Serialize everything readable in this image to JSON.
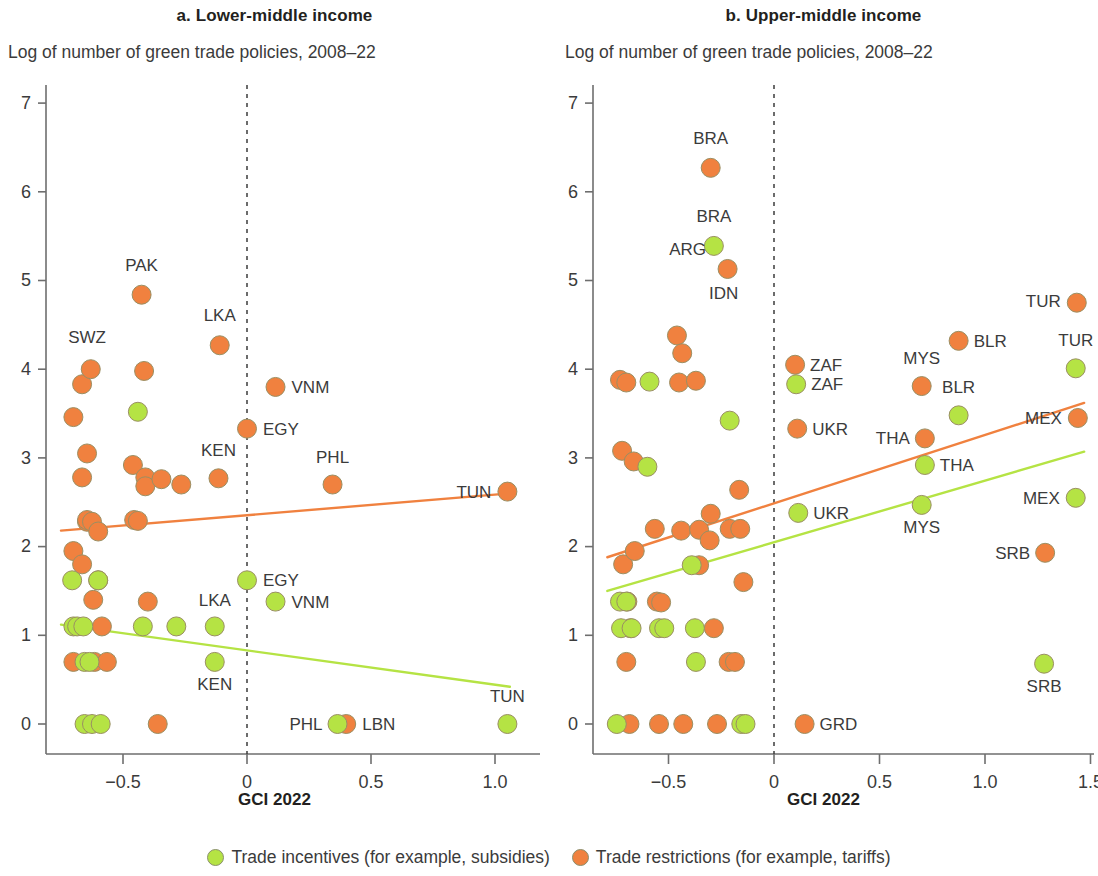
{
  "figure": {
    "x_axis_caption": "GCI 2022",
    "legend": [
      {
        "name": "trade-incentives",
        "label": "Trade incentives (for example, subsidies)",
        "color": "#b5e344"
      },
      {
        "name": "trade-restrictions",
        "label": "Trade restrictions (for example, tariffs)",
        "color": "#f0813f"
      }
    ]
  },
  "chart_data": [
    {
      "type": "scatter",
      "panel": "a",
      "title": "a. Lower-middle income",
      "subtitle": "Log of number of green trade policies, 2008–22",
      "xlabel": "GCI 2022",
      "ylabel": "Log of number of green trade policies, 2008–22",
      "xlim": [
        -0.78,
        1.13
      ],
      "ylim": [
        -0.35,
        7.45
      ],
      "xticks": [
        -0.5,
        0,
        0.5,
        1.0
      ],
      "xticklabels": [
        "−0.5",
        "0",
        "0.5",
        "1.0"
      ],
      "yticks": [
        0,
        1,
        2,
        3,
        4,
        5,
        6,
        7
      ],
      "yticklabels": [
        "0",
        "1",
        "2",
        "3",
        "4",
        "5",
        "6",
        "7"
      ],
      "grid": false,
      "reference_line_x": 0,
      "legend_position": "bottom",
      "series": [
        {
          "name": "Trade restrictions (for example, tariffs)",
          "color": "#f0813f",
          "points": [
            {
              "x": -0.7,
              "y": 3.46
            },
            {
              "x": -0.7,
              "y": 1.95
            },
            {
              "x": -0.7,
              "y": 0.7
            },
            {
              "x": -0.665,
              "y": 2.78
            },
            {
              "x": -0.665,
              "y": 1.8
            },
            {
              "x": -0.665,
              "y": 3.83
            },
            {
              "x": -0.645,
              "y": 3.05
            },
            {
              "x": -0.645,
              "y": 2.28
            },
            {
              "x": -0.645,
              "y": 2.3
            },
            {
              "x": -0.63,
              "y": 4.0
            },
            {
              "x": -0.625,
              "y": 2.28
            },
            {
              "x": -0.62,
              "y": 1.4
            },
            {
              "x": -0.615,
              "y": 0.7
            },
            {
              "x": -0.6,
              "y": 2.17
            },
            {
              "x": -0.6,
              "y": 1.62
            },
            {
              "x": -0.585,
              "y": 1.1
            },
            {
              "x": -0.565,
              "y": 0.7
            },
            {
              "x": -0.46,
              "y": 2.92
            },
            {
              "x": -0.455,
              "y": 2.3
            },
            {
              "x": -0.44,
              "y": 2.29
            },
            {
              "x": -0.425,
              "y": 4.84
            },
            {
              "x": -0.415,
              "y": 3.98
            },
            {
              "x": -0.41,
              "y": 2.78
            },
            {
              "x": -0.41,
              "y": 2.68
            },
            {
              "x": -0.4,
              "y": 1.38
            },
            {
              "x": -0.36,
              "y": 0.0
            },
            {
              "x": -0.345,
              "y": 2.76
            },
            {
              "x": -0.265,
              "y": 2.7
            },
            {
              "x": -0.11,
              "y": 4.27
            },
            {
              "x": -0.115,
              "y": 2.77
            },
            {
              "x": 0.0,
              "y": 3.33
            },
            {
              "x": 0.115,
              "y": 3.8
            },
            {
              "x": 0.345,
              "y": 2.7
            },
            {
              "x": 0.4,
              "y": 0.0
            },
            {
              "x": 1.05,
              "y": 2.62
            }
          ],
          "trend_line": {
            "x1": -0.75,
            "y1": 2.18,
            "x2": 1.06,
            "y2": 2.6
          }
        },
        {
          "name": "Trade incentives (for example, subsidies)",
          "color": "#b5e344",
          "points": [
            {
              "x": -0.705,
              "y": 1.62
            },
            {
              "x": -0.7,
              "y": 1.1
            },
            {
              "x": -0.685,
              "y": 1.1
            },
            {
              "x": -0.66,
              "y": 1.1
            },
            {
              "x": -0.655,
              "y": 0.7
            },
            {
              "x": -0.635,
              "y": 0.7
            },
            {
              "x": -0.655,
              "y": 0.0
            },
            {
              "x": -0.625,
              "y": 0.0
            },
            {
              "x": -0.59,
              "y": 0.0
            },
            {
              "x": -0.6,
              "y": 1.62
            },
            {
              "x": -0.44,
              "y": 3.52
            },
            {
              "x": -0.42,
              "y": 1.1
            },
            {
              "x": -0.285,
              "y": 1.1
            },
            {
              "x": -0.13,
              "y": 1.1
            },
            {
              "x": -0.13,
              "y": 0.7
            },
            {
              "x": 0.0,
              "y": 1.62
            },
            {
              "x": 0.115,
              "y": 1.38
            },
            {
              "x": 0.365,
              "y": 0.0
            },
            {
              "x": 1.05,
              "y": 0.0
            }
          ],
          "trend_line": {
            "x1": -0.75,
            "y1": 1.12,
            "x2": 1.06,
            "y2": 0.42
          }
        }
      ],
      "annotations": [
        {
          "text": "PAK",
          "x": -0.425,
          "y": 4.84,
          "dx": 0,
          "dy": -24,
          "anchor": "middle"
        },
        {
          "text": "SWZ",
          "x": -0.645,
          "y": 4.0,
          "dx": 0,
          "dy": -26,
          "anchor": "middle"
        },
        {
          "text": "LKA",
          "x": -0.11,
          "y": 4.27,
          "dx": 0,
          "dy": -24,
          "anchor": "middle"
        },
        {
          "text": "VNM",
          "x": 0.115,
          "y": 3.8,
          "dx": 16,
          "dy": 6,
          "anchor": "start"
        },
        {
          "text": "EGY",
          "x": 0.0,
          "y": 3.33,
          "dx": 16,
          "dy": 6,
          "anchor": "start"
        },
        {
          "text": "KEN",
          "x": -0.115,
          "y": 2.77,
          "dx": 0,
          "dy": -22,
          "anchor": "middle"
        },
        {
          "text": "PHL",
          "x": 0.345,
          "y": 2.7,
          "dx": 0,
          "dy": -22,
          "anchor": "middle"
        },
        {
          "text": "TUN",
          "x": 1.05,
          "y": 2.62,
          "dx": -16,
          "dy": 6,
          "anchor": "end"
        },
        {
          "text": "EGY",
          "x": 0.0,
          "y": 1.62,
          "dx": 16,
          "dy": 6,
          "anchor": "start"
        },
        {
          "text": "VNM",
          "x": 0.115,
          "y": 1.38,
          "dx": 16,
          "dy": 6,
          "anchor": "start"
        },
        {
          "text": "LKA",
          "x": -0.13,
          "y": 1.1,
          "dx": 0,
          "dy": -20,
          "anchor": "middle"
        },
        {
          "text": "KEN",
          "x": -0.13,
          "y": 0.7,
          "dx": 0,
          "dy": 28,
          "anchor": "middle"
        },
        {
          "text": "PHL",
          "x": 0.365,
          "y": 0.0,
          "dx": -15,
          "dy": 6,
          "anchor": "end"
        },
        {
          "text": "LBN",
          "x": 0.4,
          "y": 0.0,
          "dx": 16,
          "dy": 6,
          "anchor": "start"
        },
        {
          "text": "TUN",
          "x": 1.05,
          "y": 0.0,
          "dx": 0,
          "dy": -22,
          "anchor": "middle"
        }
      ]
    },
    {
      "type": "scatter",
      "panel": "b",
      "title": "b. Upper-middle income",
      "subtitle": "Log of number of green trade policies, 2008–22",
      "xlabel": "GCI 2022",
      "ylabel": "Log of number of green trade policies, 2008–22",
      "xlim": [
        -0.82,
        1.53
      ],
      "ylim": [
        -0.35,
        7.45
      ],
      "xticks": [
        -0.5,
        0,
        0.5,
        1.0,
        1.5
      ],
      "xticklabels": [
        "−0.5",
        "0",
        "0.5",
        "1.0",
        "1.5"
      ],
      "yticks": [
        0,
        1,
        2,
        3,
        4,
        5,
        6,
        7
      ],
      "yticklabels": [
        "0",
        "1",
        "2",
        "3",
        "4",
        "5",
        "6",
        "7"
      ],
      "grid": false,
      "reference_line_x": 0,
      "legend_position": "bottom",
      "series": [
        {
          "name": "Trade restrictions (for example, tariffs)",
          "color": "#f0813f",
          "points": [
            {
              "x": -0.73,
              "y": 3.88
            },
            {
              "x": -0.72,
              "y": 3.08
            },
            {
              "x": -0.715,
              "y": 1.8
            },
            {
              "x": -0.7,
              "y": 3.85
            },
            {
              "x": -0.7,
              "y": 0.7
            },
            {
              "x": -0.695,
              "y": 1.38
            },
            {
              "x": -0.68,
              "y": 1.08
            },
            {
              "x": -0.685,
              "y": 0.0
            },
            {
              "x": -0.665,
              "y": 2.96
            },
            {
              "x": -0.66,
              "y": 1.95
            },
            {
              "x": -0.565,
              "y": 2.2
            },
            {
              "x": -0.555,
              "y": 1.38
            },
            {
              "x": -0.535,
              "y": 1.37
            },
            {
              "x": -0.545,
              "y": 0.0
            },
            {
              "x": -0.46,
              "y": 4.38
            },
            {
              "x": -0.45,
              "y": 3.85
            },
            {
              "x": -0.44,
              "y": 2.18
            },
            {
              "x": -0.435,
              "y": 4.18
            },
            {
              "x": -0.43,
              "y": 0.0
            },
            {
              "x": -0.37,
              "y": 3.87
            },
            {
              "x": -0.355,
              "y": 2.19
            },
            {
              "x": -0.355,
              "y": 1.79
            },
            {
              "x": -0.3,
              "y": 6.27
            },
            {
              "x": -0.3,
              "y": 2.37
            },
            {
              "x": -0.305,
              "y": 2.07
            },
            {
              "x": -0.285,
              "y": 1.08
            },
            {
              "x": -0.27,
              "y": 0.0
            },
            {
              "x": -0.22,
              "y": 5.13
            },
            {
              "x": -0.21,
              "y": 2.2
            },
            {
              "x": -0.215,
              "y": 0.7
            },
            {
              "x": -0.185,
              "y": 0.7
            },
            {
              "x": -0.165,
              "y": 2.64
            },
            {
              "x": -0.16,
              "y": 2.2
            },
            {
              "x": -0.145,
              "y": 1.6
            },
            {
              "x": 0.1,
              "y": 4.05
            },
            {
              "x": 0.11,
              "y": 3.33
            },
            {
              "x": 0.145,
              "y": 0.0
            },
            {
              "x": 0.7,
              "y": 3.81
            },
            {
              "x": 0.715,
              "y": 3.22
            },
            {
              "x": 0.875,
              "y": 4.32
            },
            {
              "x": 1.285,
              "y": 1.93
            },
            {
              "x": 1.435,
              "y": 4.75
            },
            {
              "x": 1.44,
              "y": 3.45
            }
          ],
          "trend_line": {
            "x1": -0.79,
            "y1": 1.88,
            "x2": 1.47,
            "y2": 3.62
          }
        },
        {
          "name": "Trade incentives (for example, subsidies)",
          "color": "#b5e344",
          "points": [
            {
              "x": -0.745,
              "y": 0.0
            },
            {
              "x": -0.73,
              "y": 1.38
            },
            {
              "x": -0.725,
              "y": 1.08
            },
            {
              "x": -0.7,
              "y": 1.38
            },
            {
              "x": -0.675,
              "y": 1.08
            },
            {
              "x": -0.6,
              "y": 2.9
            },
            {
              "x": -0.59,
              "y": 3.86
            },
            {
              "x": -0.545,
              "y": 1.08
            },
            {
              "x": -0.52,
              "y": 1.08
            },
            {
              "x": -0.39,
              "y": 1.79
            },
            {
              "x": -0.375,
              "y": 1.08
            },
            {
              "x": -0.37,
              "y": 0.7
            },
            {
              "x": -0.21,
              "y": 3.42
            },
            {
              "x": -0.155,
              "y": 0.0
            },
            {
              "x": -0.135,
              "y": 0.0
            },
            {
              "x": -0.285,
              "y": 5.39
            },
            {
              "x": 0.105,
              "y": 3.83
            },
            {
              "x": 0.115,
              "y": 2.38
            },
            {
              "x": 0.7,
              "y": 2.47
            },
            {
              "x": 0.715,
              "y": 2.92
            },
            {
              "x": 0.875,
              "y": 3.48
            },
            {
              "x": 1.28,
              "y": 0.68
            },
            {
              "x": 1.43,
              "y": 4.01
            },
            {
              "x": 1.43,
              "y": 2.55
            }
          ],
          "trend_line": {
            "x1": -0.79,
            "y1": 1.5,
            "x2": 1.47,
            "y2": 3.07
          }
        }
      ],
      "annotations": [
        {
          "text": "BRA",
          "x": -0.3,
          "y": 6.27,
          "dx": 0,
          "dy": -24,
          "anchor": "middle"
        },
        {
          "text": "BRA",
          "x": -0.285,
          "y": 5.39,
          "dx": 0,
          "dy": -24,
          "anchor": "middle"
        },
        {
          "text": "ARG",
          "x": -0.22,
          "y": 5.13,
          "dx": -40,
          "dy": -14,
          "anchor": "middle"
        },
        {
          "text": "IDN",
          "x": -0.22,
          "y": 5.13,
          "dx": -4,
          "dy": 30,
          "anchor": "middle"
        },
        {
          "text": "ZAF",
          "x": 0.1,
          "y": 4.05,
          "dx": 15,
          "dy": 6,
          "anchor": "start"
        },
        {
          "text": "ZAF",
          "x": 0.105,
          "y": 3.83,
          "dx": 15,
          "dy": 6,
          "anchor": "start"
        },
        {
          "text": "UKR",
          "x": 0.11,
          "y": 3.33,
          "dx": 15,
          "dy": 6,
          "anchor": "start"
        },
        {
          "text": "UKR",
          "x": 0.115,
          "y": 2.38,
          "dx": 15,
          "dy": 6,
          "anchor": "start"
        },
        {
          "text": "GRD",
          "x": 0.145,
          "y": 0.0,
          "dx": 15,
          "dy": 6,
          "anchor": "start"
        },
        {
          "text": "MYS",
          "x": 0.7,
          "y": 3.81,
          "dx": 0,
          "dy": -22,
          "anchor": "middle"
        },
        {
          "text": "THA",
          "x": 0.715,
          "y": 3.22,
          "dx": -15,
          "dy": 6,
          "anchor": "end"
        },
        {
          "text": "THA",
          "x": 0.715,
          "y": 2.92,
          "dx": 15,
          "dy": 6,
          "anchor": "start"
        },
        {
          "text": "MYS",
          "x": 0.7,
          "y": 2.47,
          "dx": 0,
          "dy": 28,
          "anchor": "middle"
        },
        {
          "text": "BLR",
          "x": 0.875,
          "y": 4.32,
          "dx": 15,
          "dy": 6,
          "anchor": "start"
        },
        {
          "text": "BLR",
          "x": 0.875,
          "y": 3.48,
          "dx": 0,
          "dy": -22,
          "anchor": "middle"
        },
        {
          "text": "SRB",
          "x": 1.285,
          "y": 1.93,
          "dx": -15,
          "dy": 6,
          "anchor": "end"
        },
        {
          "text": "SRB",
          "x": 1.28,
          "y": 0.68,
          "dx": 0,
          "dy": 28,
          "anchor": "middle"
        },
        {
          "text": "TUR",
          "x": 1.435,
          "y": 4.75,
          "dx": -16,
          "dy": 4,
          "anchor": "end"
        },
        {
          "text": "TUR",
          "x": 1.43,
          "y": 4.01,
          "dx": 0,
          "dy": -22,
          "anchor": "middle"
        },
        {
          "text": "MEX",
          "x": 1.44,
          "y": 3.45,
          "dx": -16,
          "dy": 6,
          "anchor": "end"
        },
        {
          "text": "MEX",
          "x": 1.43,
          "y": 2.55,
          "dx": -16,
          "dy": 6,
          "anchor": "end"
        }
      ]
    }
  ]
}
